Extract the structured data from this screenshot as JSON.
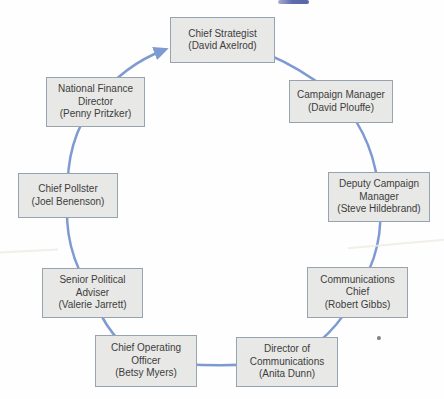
{
  "diagram": {
    "type": "cycle-org-chart",
    "colors": {
      "connector": "#7e9ad2",
      "box_fill": "#e8e8e6",
      "box_border": "#98a3b1",
      "text": "#3d3d3d"
    },
    "nodes": [
      {
        "role": "Chief Strategist",
        "person": "David Axelrod",
        "lines": [
          "Chief Strategist",
          "(David Axelrod)"
        ]
      },
      {
        "role": "Campaign Manager",
        "person": "David Plouffe",
        "lines": [
          "Campaign Manager",
          "(David Plouffe)"
        ]
      },
      {
        "role": "Deputy Campaign Manager",
        "person": "Steve Hildebrand",
        "lines": [
          "Deputy Campaign",
          "Manager",
          "(Steve Hildebrand)"
        ]
      },
      {
        "role": "Communications Chief",
        "person": "Robert Gibbs",
        "lines": [
          "Communications",
          "Chief",
          "(Robert Gibbs)"
        ]
      },
      {
        "role": "Director of Communications",
        "person": "Anita Dunn",
        "lines": [
          "Director of",
          "Communications",
          "(Anita Dunn)"
        ]
      },
      {
        "role": "Chief Operating Officer",
        "person": "Betsy Myers",
        "lines": [
          "Chief Operating",
          "Officer",
          "(Betsy Myers)"
        ]
      },
      {
        "role": "Senior Political Adviser",
        "person": "Valerie Jarrett",
        "lines": [
          "Senior Political",
          "Adviser",
          "(Valerie Jarrett)"
        ]
      },
      {
        "role": "Chief Pollster",
        "person": "Joel Benenson",
        "lines": [
          "Chief Pollster",
          "(Joel Benenson)"
        ]
      },
      {
        "role": "National Finance Director",
        "person": "Penny Pritzker",
        "lines": [
          "National Finance",
          "Director",
          "(Penny Pritzker)"
        ]
      }
    ]
  }
}
